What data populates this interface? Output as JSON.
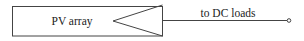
{
  "diagram": {
    "block": {
      "label": "PV array"
    },
    "output": {
      "label": "to DC loads"
    },
    "colors": {
      "stroke": "#333333",
      "text": "#222222",
      "background": "#ffffff"
    }
  }
}
